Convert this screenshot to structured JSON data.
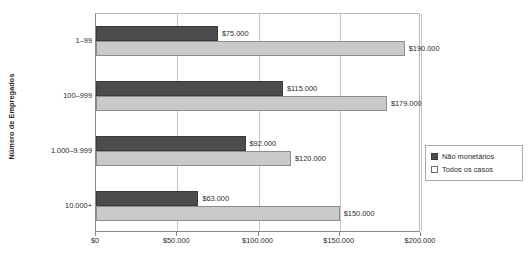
{
  "chart_data": {
    "type": "bar",
    "orientation": "horizontal",
    "title": "",
    "xlabel": "",
    "ylabel": "Número de Empregados",
    "categories": [
      "1–99",
      "100–999",
      "1.000–9.999",
      "10.000+"
    ],
    "xlim": [
      0,
      200000
    ],
    "xticks": [
      0,
      50000,
      100000,
      150000,
      200000
    ],
    "xticklabels": [
      "$0",
      "$50.000",
      "$100.000",
      "$150.000",
      "$200.000"
    ],
    "grid": "vertical",
    "legend_position": "right-outside",
    "series": [
      {
        "name": "Não monetários",
        "color": "#4c4c4c",
        "values": [
          75000,
          115000,
          92000,
          63000
        ],
        "labels": [
          "$75.000",
          "$115.000",
          "$92.000",
          "$63.000"
        ]
      },
      {
        "name": "Todos os casos",
        "color": "#c9c9c9",
        "values": [
          190000,
          179000,
          120000,
          150000
        ],
        "labels": [
          "$190.000",
          "$179.000",
          "$120.000",
          "$150.000"
        ]
      }
    ]
  },
  "legend": {
    "items": [
      {
        "label": "Não monetários"
      },
      {
        "label": "Todos os casos"
      }
    ]
  },
  "axis": {
    "y_title": "Número de Empregados"
  }
}
